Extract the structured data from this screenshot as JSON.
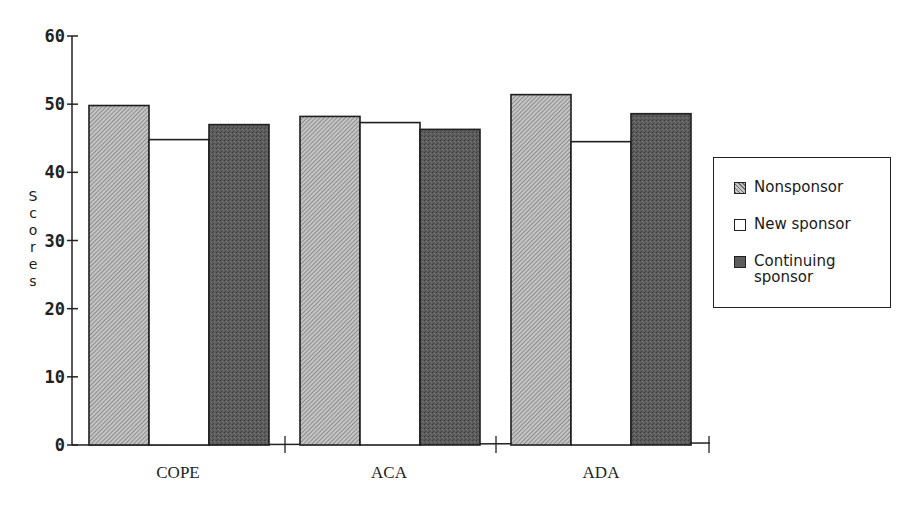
{
  "chart_data": {
    "type": "bar",
    "title": "",
    "xlabel": "",
    "ylabel": "Scores",
    "categories": [
      "COPE",
      "ACA",
      "ADA"
    ],
    "series": [
      {
        "name": "Nonsponsor",
        "values": [
          49.8,
          48.2,
          51.4
        ],
        "fill": "hatched-light-gray"
      },
      {
        "name": "New sponsor",
        "values": [
          44.8,
          47.3,
          44.5
        ],
        "fill": "white"
      },
      {
        "name": "Continuing sponsor",
        "values": [
          47.0,
          46.3,
          48.6
        ],
        "fill": "dark-gray-stipple"
      }
    ],
    "ylim": [
      0,
      60
    ],
    "yticks": [
      "0",
      "10",
      "20",
      "30",
      "40",
      "50",
      "60"
    ],
    "grid": false,
    "legend_position": "right"
  },
  "legend": {
    "items": [
      {
        "label": "Nonsponsor"
      },
      {
        "label": "New sponsor"
      },
      {
        "label": "Continuing sponsor"
      }
    ]
  },
  "axes": {
    "ylabel_letters": [
      "S",
      "c",
      "o",
      "r",
      "e",
      "s"
    ]
  },
  "colors": {
    "axis": "#222222",
    "nonsponsor_base": "#b8b8b8",
    "nonsponsor_hatch": "#555555",
    "new_sponsor": "#ffffff",
    "continuing_sponsor": "#5a5a5a"
  }
}
